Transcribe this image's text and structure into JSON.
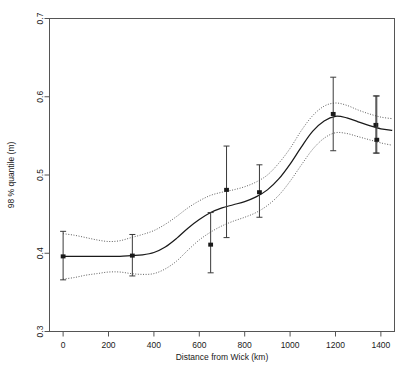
{
  "chart_data": {
    "type": "line",
    "title": "",
    "subtitle": "",
    "xlabel": "Distance from Wick (km)",
    "ylabel": "98 % quantile (m)",
    "xlim": [
      -60,
      1460
    ],
    "ylim": [
      0.3,
      0.7
    ],
    "xticks": [
      0,
      200,
      400,
      600,
      800,
      1000,
      1200,
      1400
    ],
    "xticklabels": [
      "0",
      "200",
      "400",
      "600",
      "800",
      "1000",
      "1200",
      "1400"
    ],
    "yticks": [
      0.3,
      0.4,
      0.5,
      0.6,
      0.7
    ],
    "yticklabels": [
      "0.3",
      "0.4",
      "0.5",
      "0.6",
      "0.7"
    ],
    "grid": false,
    "legend": "none",
    "frame": true,
    "series": [
      {
        "name": "fitted mean",
        "style": "solid",
        "color": "#1a1a1a",
        "x": [
          0,
          50,
          100,
          150,
          200,
          250,
          300,
          350,
          400,
          450,
          500,
          550,
          600,
          650,
          700,
          750,
          800,
          850,
          900,
          950,
          1000,
          1050,
          1100,
          1150,
          1200,
          1250,
          1300,
          1350,
          1400,
          1450
        ],
        "y": [
          0.396,
          0.396,
          0.396,
          0.396,
          0.396,
          0.396,
          0.397,
          0.398,
          0.401,
          0.408,
          0.419,
          0.432,
          0.443,
          0.452,
          0.458,
          0.462,
          0.466,
          0.472,
          0.481,
          0.495,
          0.514,
          0.536,
          0.556,
          0.569,
          0.575,
          0.573,
          0.568,
          0.563,
          0.559,
          0.557
        ]
      },
      {
        "name": "upper confidence band",
        "style": "dotted",
        "color": "#4d4d4d",
        "x": [
          0,
          50,
          100,
          150,
          200,
          250,
          300,
          350,
          400,
          450,
          500,
          550,
          600,
          650,
          700,
          750,
          800,
          850,
          900,
          950,
          1000,
          1050,
          1100,
          1150,
          1200,
          1250,
          1300,
          1350,
          1400,
          1450
        ],
        "y": [
          0.425,
          0.423,
          0.42,
          0.417,
          0.415,
          0.416,
          0.42,
          0.424,
          0.429,
          0.437,
          0.447,
          0.458,
          0.467,
          0.474,
          0.478,
          0.481,
          0.485,
          0.491,
          0.5,
          0.515,
          0.534,
          0.557,
          0.576,
          0.588,
          0.592,
          0.589,
          0.583,
          0.578,
          0.574,
          0.572
        ]
      },
      {
        "name": "lower confidence band",
        "style": "dotted",
        "color": "#4d4d4d",
        "x": [
          0,
          50,
          100,
          150,
          200,
          250,
          300,
          350,
          400,
          450,
          500,
          550,
          600,
          650,
          700,
          750,
          800,
          850,
          900,
          950,
          1000,
          1050,
          1100,
          1150,
          1200,
          1250,
          1300,
          1350,
          1400,
          1450
        ],
        "y": [
          0.367,
          0.369,
          0.372,
          0.374,
          0.376,
          0.376,
          0.374,
          0.373,
          0.374,
          0.38,
          0.39,
          0.404,
          0.417,
          0.427,
          0.435,
          0.441,
          0.446,
          0.452,
          0.461,
          0.474,
          0.492,
          0.513,
          0.533,
          0.547,
          0.554,
          0.553,
          0.549,
          0.545,
          0.541,
          0.538
        ]
      }
    ],
    "points": [
      {
        "x": 0,
        "y": 0.396,
        "yerr_low": 0.366,
        "yerr_high": 0.428
      },
      {
        "x": 305,
        "y": 0.397,
        "yerr_low": 0.371,
        "yerr_high": 0.424
      },
      {
        "x": 650,
        "y": 0.411,
        "yerr_low": 0.375,
        "yerr_high": 0.452
      },
      {
        "x": 720,
        "y": 0.481,
        "yerr_low": 0.42,
        "yerr_high": 0.537
      },
      {
        "x": 865,
        "y": 0.478,
        "yerr_low": 0.446,
        "yerr_high": 0.513
      },
      {
        "x": 1190,
        "y": 0.578,
        "yerr_low": 0.531,
        "yerr_high": 0.625
      },
      {
        "x": 1378,
        "y": 0.564,
        "yerr_low": 0.528,
        "yerr_high": 0.601
      },
      {
        "x": 1382,
        "y": 0.545,
        "yerr_low": 0.528,
        "yerr_high": 0.601
      }
    ]
  }
}
